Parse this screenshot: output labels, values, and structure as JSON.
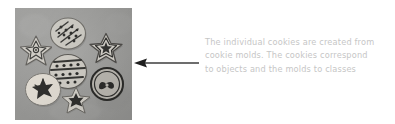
{
  "figure": {
    "name": "cookies-and-molds-analogy-figure",
    "caption": {
      "lines": [
        "The individual cookies are created from",
        "cookie molds. The cookies correspond",
        "to objects and the molds to classes"
      ],
      "full_text": "The individual cookies are created from cookie molds. The cookies correspond to objects and the molds to classes",
      "color": "#c6c6c6"
    },
    "arrow": {
      "direction": "left",
      "color": "#3d3d3d",
      "points_to": "photo-of-cookies"
    },
    "photo": {
      "alt": "Photograph of decorated cookies arranged on a gray surface",
      "background_color": "#9d9d9b",
      "cookies": [
        {
          "shape": "round",
          "decoration": "diagonal-stripes-and-dots",
          "tone": "light"
        },
        {
          "shape": "star",
          "decoration": "outlined-floral",
          "tone": "light"
        },
        {
          "shape": "star",
          "decoration": "star-burst",
          "tone": "light"
        },
        {
          "shape": "round",
          "decoration": "horizontal-stripes-and-dots",
          "tone": "light"
        },
        {
          "shape": "round",
          "decoration": "bow-motif-ring",
          "tone": "dark"
        },
        {
          "shape": "round",
          "decoration": "dark-floral-center",
          "tone": "pale"
        },
        {
          "shape": "star",
          "decoration": "dark-floral-center",
          "tone": "light"
        }
      ]
    }
  }
}
